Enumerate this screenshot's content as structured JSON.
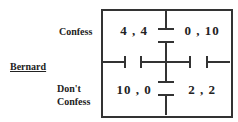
{
  "game": {
    "row_player": "Bernard",
    "row_strategies": [
      {
        "label": "Confess"
      },
      {
        "label_line1": "Don't",
        "label_line2": "Confess"
      }
    ],
    "payoffs": [
      [
        "4 , 4",
        "0 , 10"
      ],
      [
        "10 , 0",
        "2 , 2"
      ]
    ]
  },
  "colors": {
    "line": "#333333",
    "text": "#222222",
    "background": "#ffffff"
  }
}
